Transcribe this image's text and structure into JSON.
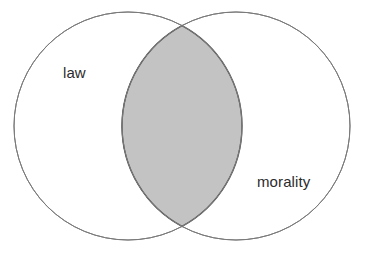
{
  "figure": {
    "type": "venn-diagram",
    "background_color": "#ffffff",
    "width": 367,
    "height": 253
  },
  "chart_data": {
    "type": "venn",
    "title": "",
    "sets": [
      {
        "id": "left",
        "label": "law",
        "center_x": 128,
        "center_y": 126,
        "radius": 114,
        "fill": "#ffffff",
        "stroke": "#7a7a7a",
        "stroke_width": 1,
        "label_x": 78,
        "label_y": 72
      },
      {
        "id": "right",
        "label": "morality",
        "center_x": 236,
        "center_y": 126,
        "radius": 114,
        "fill": "#ffffff",
        "stroke": "#7a7a7a",
        "stroke_width": 1,
        "label_x": 288,
        "label_y": 182
      }
    ],
    "intersection": {
      "label": "",
      "highlighted": true,
      "fill": "#c3c3c3",
      "stroke": "#555555",
      "stroke_width": 1.4,
      "top_point_x": 182,
      "top_point_y": 27,
      "bottom_point_x": 182,
      "bottom_point_y": 225,
      "left_extent_x": 130,
      "right_extent_x": 234
    },
    "legend": "none",
    "grid": false,
    "axis": "none"
  },
  "colors": {
    "circle_stroke": "#7a7a7a",
    "intersection_fill": "#c3c3c3",
    "intersection_stroke": "#555555",
    "label_text": "#2b2b2b",
    "background": "#ffffff"
  }
}
